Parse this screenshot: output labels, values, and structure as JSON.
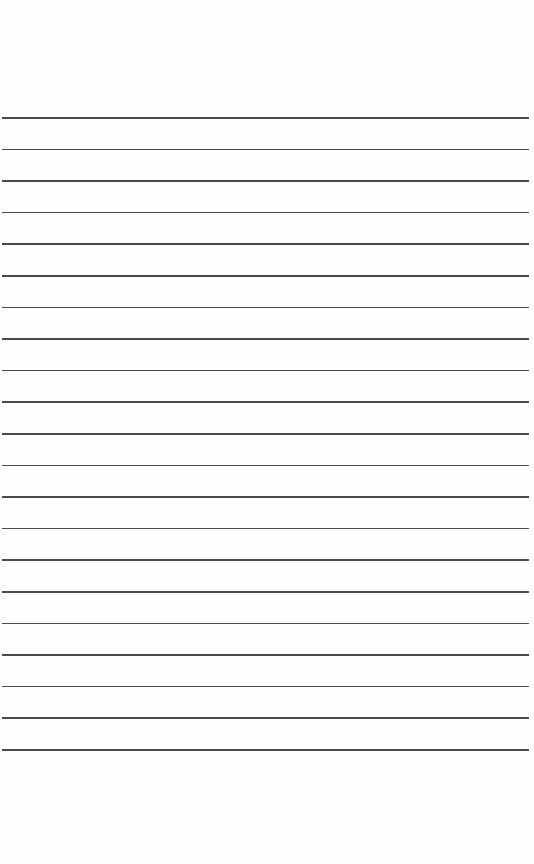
{
  "page": {
    "type": "lined-paper",
    "background_color": "#fefefe",
    "line_color": "#4a4a4a",
    "line_count": 21,
    "first_line_y": 117,
    "line_spacing": 31.6,
    "line_left": 2,
    "line_right": 529
  }
}
